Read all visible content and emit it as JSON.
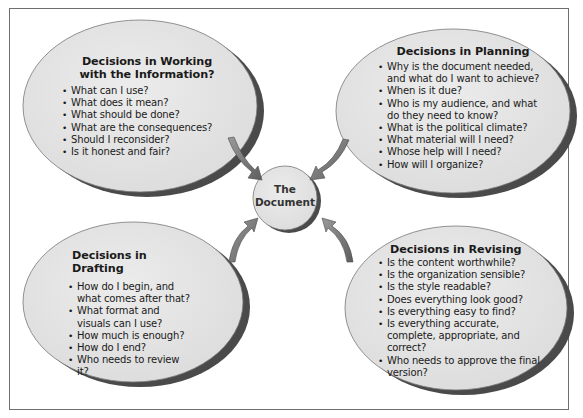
{
  "diagram": {
    "center": {
      "line1": "The",
      "line2": "Document"
    },
    "bubbles": [
      {
        "id": "working",
        "title_line1": "Decisions in Working",
        "title_line2": "with the Information?",
        "items": [
          "What can I use?",
          "What does it mean?",
          "What should be done?",
          "What are the consequences?",
          "Should I reconsider?",
          "Is it honest and fair?"
        ]
      },
      {
        "id": "planning",
        "title_line1": "Decisions in Planning",
        "items": [
          "Why is the document needed, and what do I want to achieve?",
          "When is it due?",
          "Who is my audience, and what do they need to know?",
          "What is the political climate?",
          "What material will I need?",
          "Whose help will I need?",
          "How will I organize?"
        ]
      },
      {
        "id": "drafting",
        "title_line1": "Decisions in Drafting",
        "items": [
          "How do I begin, and what comes after that?",
          "What format and visuals can I use?",
          "How much is enough?",
          "How do I end?",
          "Who needs to review it?"
        ]
      },
      {
        "id": "revising",
        "title_line1": "Decisions in Revising",
        "items": [
          "Is the content worthwhile?",
          "Is the organization sensible?",
          "Is the style readable?",
          "Does everything look good?",
          "Is everything easy to find?",
          "Is everything accurate, complete, appropriate, and correct?",
          "Who needs to approve the final version?"
        ]
      }
    ],
    "colors": {
      "bubble_fill": "#e4e4e4",
      "bubble_shadow": "#555555",
      "arrow": "#7a7a7a",
      "frame": "#6f6f6f",
      "text": "#1a1a1a"
    }
  }
}
